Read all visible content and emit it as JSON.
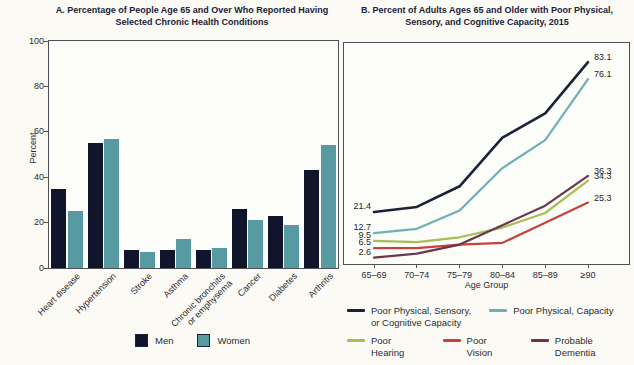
{
  "figure": {
    "background": "#fbfaf5",
    "text_color": "#2b2b31",
    "title_color": "#1a2138",
    "border_color": "#4f4f55"
  },
  "chart_data": [
    {
      "type": "bar",
      "title": "A. Percentage of People Age 65 and Over Who Reported Having Selected Chronic Health Conditions",
      "ylabel": "Percent",
      "xlabel": "",
      "ylim": [
        0,
        100
      ],
      "yticks": [
        0,
        20,
        40,
        60,
        80,
        100
      ],
      "grid": false,
      "legend_position": "bottom",
      "categories": [
        "Heart disease",
        "Hypertension",
        "Stroke",
        "Asthma",
        "Chronic bronchitis\nor emphysema",
        "Cancer",
        "Diabetes",
        "Arthritis"
      ],
      "series": [
        {
          "name": "Men",
          "color": "#10152b",
          "values": [
            35,
            55,
            8,
            8,
            8,
            26,
            23,
            43
          ]
        },
        {
          "name": "Women",
          "color": "#579aa2",
          "values": [
            25,
            57,
            7,
            13,
            9,
            21,
            19,
            54
          ]
        }
      ]
    },
    {
      "type": "line",
      "title": "B. Percent of Adults Ages 65 and Older with Poor Physical, Sensory, and Cognitive Capacity, 2015",
      "xlabel": "Age Group",
      "ylabel": "",
      "ylim": [
        0,
        91
      ],
      "grid": false,
      "legend_position": "bottom",
      "categories": [
        "65–69",
        "70–74",
        "75–79",
        "80–84",
        "85–89",
        "≥90"
      ],
      "series": [
        {
          "name": "Poor Physical, Sensory,\nor Cognitive Capacity",
          "color": "#1b2238",
          "values": [
            21.4,
            23.5,
            32,
            52,
            62,
            83.1
          ],
          "start_label": "21.4",
          "end_label": "83.1"
        },
        {
          "name": "Poor Physical, Capacity",
          "color": "#6fafb6",
          "values": [
            12.7,
            14.5,
            22,
            39.5,
            51,
            76.1
          ],
          "start_label": "12.7",
          "end_label": "76.1"
        },
        {
          "name": "Poor Hearing",
          "color": "#a3bf56",
          "values": [
            9.5,
            9,
            11,
            15,
            21,
            34.3
          ],
          "start_label": "9.5",
          "end_label": "34.3"
        },
        {
          "name": "Poor Vision",
          "color": "#c1453c",
          "values": [
            6.5,
            6.5,
            8,
            8.7,
            17,
            25.3
          ],
          "start_label": "6.5",
          "end_label": "25.3"
        },
        {
          "name": "Probable Dementia",
          "color": "#6b3648",
          "values": [
            2.6,
            4.3,
            8,
            16,
            24,
            36.3
          ],
          "start_label": "2.6",
          "end_label": "36.3"
        }
      ],
      "legend_rows": [
        [
          0,
          1
        ],
        [
          2,
          3,
          4
        ]
      ]
    }
  ]
}
